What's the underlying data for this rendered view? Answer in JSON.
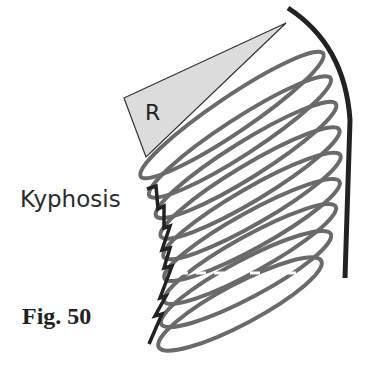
{
  "figure": {
    "label": "Fig. 50",
    "condition_label": "Kyphosis",
    "wedge_label": "R"
  },
  "colors": {
    "rib": "#6a6a6a",
    "spine_curve": "#222222",
    "wedge_fill": "#dcdcdc",
    "wedge_stroke": "#333333",
    "zigzag": "#222222"
  },
  "diagram": {
    "rib_count": 9,
    "elements": [
      "rib-cage-ellipses",
      "curved-back-line",
      "wedge-triangle",
      "sternum-zigzag"
    ]
  }
}
